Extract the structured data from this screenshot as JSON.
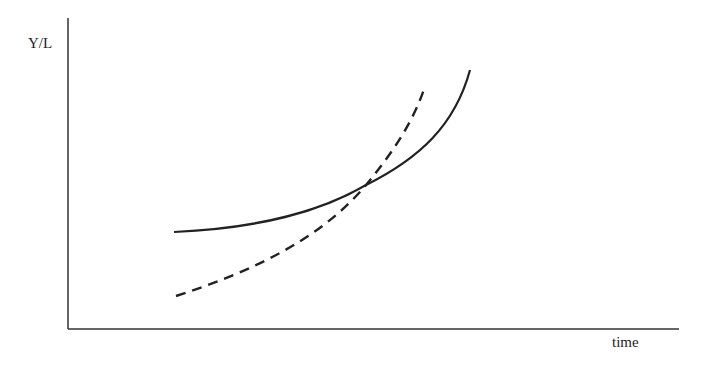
{
  "diagram": {
    "y_label": "Y/L",
    "x_label": "time",
    "curves": [
      {
        "name": "solid-curve",
        "style": "solid",
        "description": "slower initial growth, accelerating later"
      },
      {
        "name": "dashed-curve",
        "style": "dashed",
        "description": "lower start, faster growth, crosses solid curve"
      }
    ],
    "colors": {
      "line": "#222222",
      "background": "#ffffff"
    }
  }
}
